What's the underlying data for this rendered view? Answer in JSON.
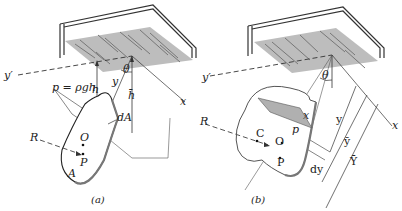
{
  "figure": {
    "panel_a": {
      "caption": "(a)",
      "labels": {
        "y_prime": "y′",
        "h": "h",
        "y": "y",
        "h_bar": "h̄",
        "theta": "θ",
        "x": "x",
        "pressure": "p = ρgh",
        "dA": "dA",
        "O": "O",
        "P": "P",
        "R": "R",
        "A": "A"
      }
    },
    "panel_b": {
      "caption": "(b)",
      "labels": {
        "y_prime": "y′",
        "theta": "θ",
        "x": "x",
        "R": "R",
        "C": "C",
        "O": "O",
        "P": "P",
        "p": "p",
        "x_small": "x",
        "y": "y",
        "y_bar": "ȳ",
        "Y_bar": "Ȳ",
        "dy": "dy"
      }
    },
    "colors": {
      "line": "#333333",
      "surface": "#b8b8b8",
      "plate_edge": "#6e6e6e"
    }
  }
}
